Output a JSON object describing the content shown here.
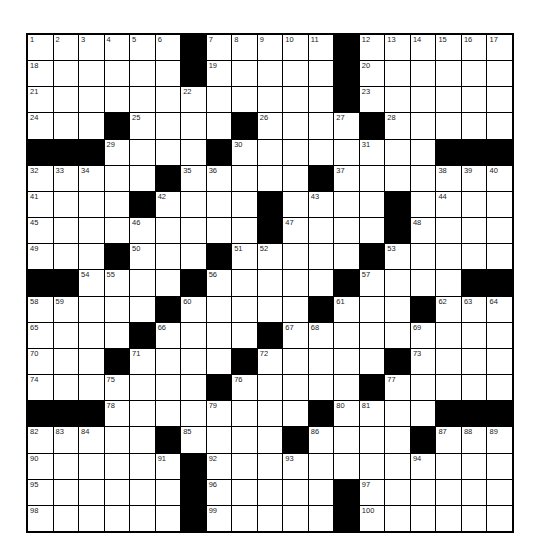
{
  "puzzle": {
    "rows": 19,
    "cols": 19,
    "grid": [
      "......#.....#......",
      "......#.....#......",
      "............#......",
      "...#....#....#.....",
      "###....#........###",
      ".....#.....#.......",
      "....#....#....#....",
      ".........#....#....",
      "...#...#.....#.....",
      "##....#.....#....##",
      ".....#.....#...#...",
      "....#....#.........",
      "...#....#.....#....",
      ".......#.....#.....",
      "###........#....###",
      ".....#....#....#...",
      "......#............",
      "......#.....#......",
      "......#.....#......"
    ],
    "numbers": [
      [
        0,
        0,
        1
      ],
      [
        0,
        1,
        2
      ],
      [
        0,
        2,
        3
      ],
      [
        0,
        3,
        4
      ],
      [
        0,
        4,
        5
      ],
      [
        0,
        5,
        6
      ],
      [
        0,
        7,
        7
      ],
      [
        0,
        8,
        8
      ],
      [
        0,
        9,
        9
      ],
      [
        0,
        10,
        10
      ],
      [
        0,
        11,
        11
      ],
      [
        0,
        13,
        12
      ],
      [
        0,
        14,
        13
      ],
      [
        0,
        15,
        14
      ],
      [
        0,
        16,
        15
      ],
      [
        0,
        17,
        16
      ],
      [
        0,
        18,
        17
      ],
      [
        1,
        0,
        18
      ],
      [
        1,
        7,
        19
      ],
      [
        1,
        13,
        20
      ],
      [
        2,
        0,
        21
      ],
      [
        2,
        6,
        22
      ],
      [
        2,
        13,
        23
      ],
      [
        3,
        0,
        24
      ],
      [
        3,
        4,
        25
      ],
      [
        3,
        9,
        26
      ],
      [
        3,
        12,
        27
      ],
      [
        3,
        14,
        28
      ],
      [
        4,
        3,
        29
      ],
      [
        4,
        8,
        30
      ],
      [
        4,
        13,
        31
      ],
      [
        5,
        0,
        32
      ],
      [
        5,
        1,
        33
      ],
      [
        5,
        2,
        34
      ],
      [
        5,
        6,
        35
      ],
      [
        5,
        7,
        36
      ],
      [
        5,
        12,
        37
      ],
      [
        5,
        16,
        38
      ],
      [
        5,
        17,
        39
      ],
      [
        5,
        18,
        40
      ],
      [
        6,
        0,
        41
      ],
      [
        6,
        5,
        42
      ],
      [
        6,
        11,
        43
      ],
      [
        6,
        16,
        44
      ],
      [
        7,
        0,
        45
      ],
      [
        7,
        4,
        46
      ],
      [
        7,
        10,
        47
      ],
      [
        7,
        15,
        48
      ],
      [
        8,
        0,
        49
      ],
      [
        8,
        4,
        50
      ],
      [
        8,
        8,
        51
      ],
      [
        8,
        9,
        52
      ],
      [
        8,
        14,
        53
      ],
      [
        9,
        2,
        54
      ],
      [
        9,
        3,
        55
      ],
      [
        9,
        7,
        56
      ],
      [
        9,
        13,
        57
      ],
      [
        10,
        0,
        58
      ],
      [
        10,
        1,
        59
      ],
      [
        10,
        6,
        60
      ],
      [
        10,
        12,
        61
      ],
      [
        10,
        16,
        62
      ],
      [
        10,
        17,
        63
      ],
      [
        10,
        18,
        64
      ],
      [
        11,
        0,
        65
      ],
      [
        11,
        5,
        66
      ],
      [
        11,
        10,
        67
      ],
      [
        11,
        11,
        68
      ],
      [
        11,
        15,
        69
      ],
      [
        12,
        0,
        70
      ],
      [
        12,
        4,
        71
      ],
      [
        12,
        9,
        72
      ],
      [
        12,
        15,
        73
      ],
      [
        13,
        0,
        74
      ],
      [
        13,
        3,
        75
      ],
      [
        13,
        8,
        76
      ],
      [
        13,
        14,
        77
      ],
      [
        14,
        3,
        78
      ],
      [
        14,
        7,
        79
      ],
      [
        14,
        12,
        80
      ],
      [
        14,
        13,
        81
      ],
      [
        15,
        0,
        82
      ],
      [
        15,
        1,
        83
      ],
      [
        15,
        2,
        84
      ],
      [
        15,
        6,
        85
      ],
      [
        15,
        11,
        86
      ],
      [
        15,
        16,
        87
      ],
      [
        15,
        17,
        88
      ],
      [
        15,
        18,
        89
      ],
      [
        16,
        0,
        90
      ],
      [
        16,
        5,
        91
      ],
      [
        16,
        7,
        92
      ],
      [
        16,
        10,
        93
      ],
      [
        16,
        15,
        94
      ],
      [
        17,
        0,
        95
      ],
      [
        17,
        7,
        96
      ],
      [
        17,
        13,
        97
      ],
      [
        18,
        0,
        98
      ],
      [
        18,
        7,
        99
      ],
      [
        18,
        13,
        100
      ]
    ]
  },
  "colors": {
    "block": "#000000",
    "cell": "#ffffff",
    "number": "#222222"
  }
}
